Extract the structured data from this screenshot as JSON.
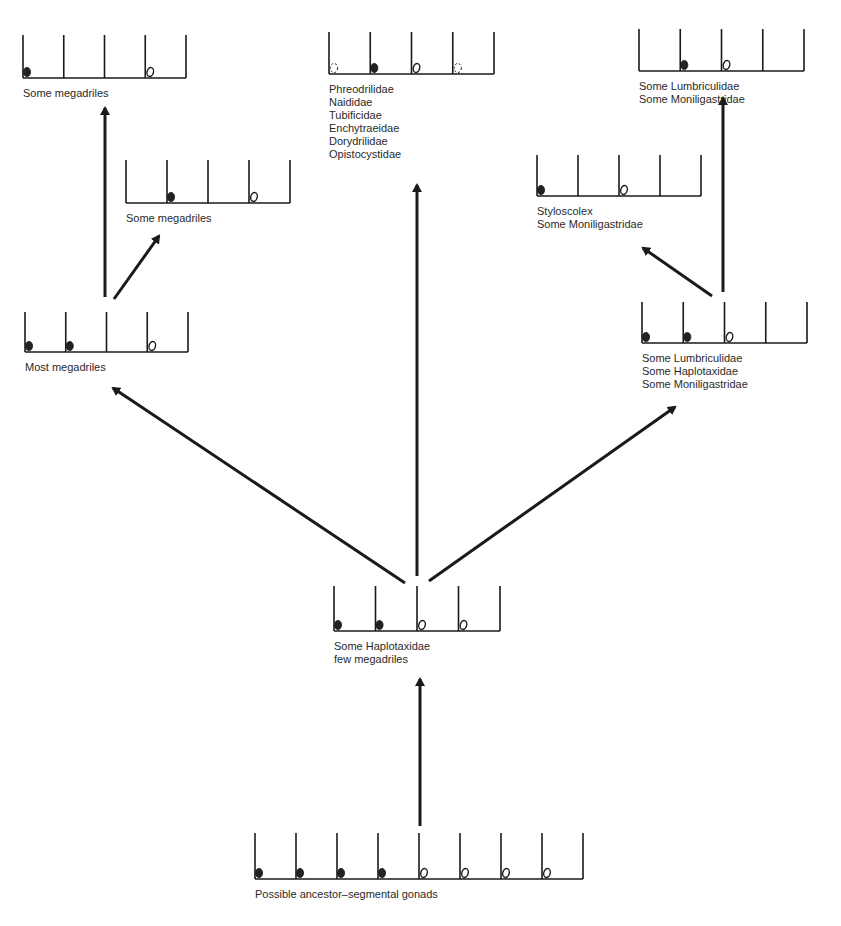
{
  "diagram": {
    "type": "phylogeny of gonad arrangement",
    "colors": {
      "ink": "#1a1a1a",
      "text": "#2a2a2a",
      "background": "#ffffff"
    },
    "nodes": [
      {
        "id": "top-left",
        "label_lines": [
          "Some megadriles"
        ],
        "segments": [
          "filled",
          "empty",
          "empty",
          "open",
          "empty"
        ],
        "box": {
          "x": 23,
          "y": 35,
          "w": 163,
          "h": 43
        }
      },
      {
        "id": "top-center",
        "label_lines": [
          "Phreodrilidae",
          "Naididae",
          "Tubificidae",
          "Enchytraeidae",
          "Dorydrilidae",
          "Opistocystidae"
        ],
        "segments": [
          "dashed",
          "filled",
          "open",
          "dashed",
          "empty"
        ],
        "box": {
          "x": 329,
          "y": 32,
          "w": 165,
          "h": 42
        }
      },
      {
        "id": "top-right",
        "label_lines": [
          "Some Lumbriculidae",
          "Some Moniligastridae"
        ],
        "segments": [
          "empty",
          "filled",
          "open",
          "empty",
          "empty"
        ],
        "box": {
          "x": 639,
          "y": 29,
          "w": 165,
          "h": 42
        }
      },
      {
        "id": "mid-left-upper",
        "label_lines": [
          "Some megadriles"
        ],
        "segments": [
          "empty",
          "filled",
          "empty",
          "open",
          "empty"
        ],
        "box": {
          "x": 126,
          "y": 160,
          "w": 164,
          "h": 43
        }
      },
      {
        "id": "mid-right-upper",
        "label_lines": [
          "Styloscolex",
          "Some Moniligastridae"
        ],
        "segments": [
          "filled",
          "empty",
          "open",
          "empty",
          "empty"
        ],
        "box": {
          "x": 537,
          "y": 155,
          "w": 164,
          "h": 41
        }
      },
      {
        "id": "mid-left",
        "label_lines": [
          "Most megadriles"
        ],
        "segments": [
          "filled",
          "filled",
          "empty",
          "open",
          "empty"
        ],
        "box": {
          "x": 25,
          "y": 312,
          "w": 163,
          "h": 40
        }
      },
      {
        "id": "mid-right",
        "label_lines": [
          "Some Lumbriculidae",
          "Some Haplotaxidae",
          "Some Moniligastridae"
        ],
        "segments": [
          "filled",
          "filled",
          "open",
          "empty",
          "empty"
        ],
        "box": {
          "x": 642,
          "y": 302,
          "w": 165,
          "h": 41
        }
      },
      {
        "id": "center",
        "label_lines": [
          "Some Haplotaxidae",
          "few megadriles"
        ],
        "segments": [
          "filled",
          "filled",
          "open",
          "open",
          "empty"
        ],
        "box": {
          "x": 334,
          "y": 586,
          "w": 166,
          "h": 45
        }
      },
      {
        "id": "ancestor",
        "label_lines": [
          "Possible ancestor–segmental gonads"
        ],
        "segments": [
          "filled",
          "filled",
          "filled",
          "filled",
          "open",
          "open",
          "open",
          "open",
          "empty"
        ],
        "box": {
          "x": 255,
          "y": 833,
          "w": 328,
          "h": 46
        }
      }
    ],
    "arrows": [
      {
        "from": "ancestor",
        "to": "center",
        "x1": 420,
        "y1": 826,
        "x2": 420,
        "y2": 679
      },
      {
        "from": "center",
        "to": "top-center",
        "x1": 417,
        "y1": 576,
        "x2": 417,
        "y2": 185
      },
      {
        "from": "center",
        "to": "mid-left",
        "x1": 405,
        "y1": 583,
        "x2": 113,
        "y2": 388
      },
      {
        "from": "center",
        "to": "mid-right",
        "x1": 429,
        "y1": 581,
        "x2": 675,
        "y2": 407
      },
      {
        "from": "mid-left",
        "to": "top-left",
        "x1": 105,
        "y1": 297,
        "x2": 105,
        "y2": 108
      },
      {
        "from": "mid-left",
        "to": "mid-left-upper",
        "x1": 114,
        "y1": 299,
        "x2": 159,
        "y2": 236
      },
      {
        "from": "mid-right",
        "to": "top-right",
        "x1": 723,
        "y1": 292,
        "x2": 723,
        "y2": 98
      },
      {
        "from": "mid-right",
        "to": "mid-right-upper",
        "x1": 712,
        "y1": 296,
        "x2": 643,
        "y2": 248
      }
    ]
  }
}
